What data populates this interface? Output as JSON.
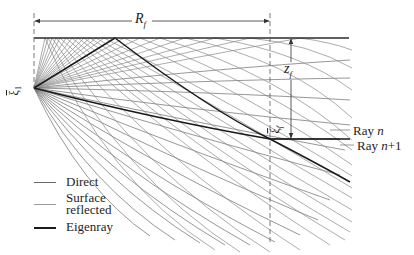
{
  "figure": {
    "labels": {
      "range": "R",
      "range_sub": "f",
      "depth": "z",
      "depth_sub": "f",
      "source_vector": "ξ",
      "source_sub": "1",
      "receiver_vector": "ξ",
      "receiver_sub": "f",
      "ray_n": "Ray ",
      "ray_n_var": "n",
      "ray_n1": "Ray ",
      "ray_n1_var": "n",
      "ray_n1_suffix": "+1"
    },
    "legend": {
      "items": [
        {
          "label": "Direct",
          "style": "thin-gray"
        },
        {
          "label_line1": "Surface",
          "label_line2": "reflected",
          "style": "thin-light-gray"
        },
        {
          "label": "Eigenray",
          "style": "thick-black"
        }
      ]
    },
    "colors": {
      "ray": "#6a6a6a",
      "reflected_ray": "#8a8a8a",
      "eigenray": "#1a1a1a",
      "surface": "#2a2a2a",
      "dashed": "#555555"
    }
  }
}
